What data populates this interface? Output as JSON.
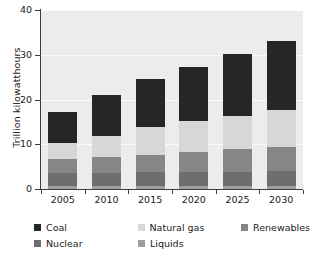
{
  "chart_data": {
    "type": "bar",
    "stacked": true,
    "title": "",
    "xlabel": "",
    "ylabel": "Trillion kilowatthours",
    "categories": [
      "2005",
      "2010",
      "2015",
      "2020",
      "2025",
      "2030"
    ],
    "ylim": [
      0,
      40
    ],
    "yticks": [
      0,
      10,
      20,
      30,
      40
    ],
    "ytick_labels": [
      "0",
      "10",
      "20",
      "30",
      "40"
    ],
    "grid": true,
    "legend_position": "bottom",
    "series": [
      {
        "name": "Liquids",
        "color": "#9e9e9e",
        "values": [
          0.7,
          0.7,
          0.6,
          0.6,
          0.6,
          0.6
        ]
      },
      {
        "name": "Nuclear",
        "color": "#6e6e6e",
        "values": [
          2.8,
          2.9,
          3.1,
          3.2,
          3.3,
          3.5
        ]
      },
      {
        "name": "Renewables",
        "color": "#868686",
        "values": [
          3.1,
          3.5,
          4.0,
          4.5,
          5.0,
          5.4
        ]
      },
      {
        "name": "Natural gas",
        "color": "#d7d7d7",
        "values": [
          3.6,
          4.7,
          6.1,
          6.9,
          7.5,
          8.2
        ]
      },
      {
        "name": "Coal",
        "color": "#262626",
        "values": [
          6.9,
          9.2,
          10.7,
          12.0,
          13.7,
          15.4
        ]
      }
    ],
    "totals": [
      17.1,
      21.0,
      24.5,
      27.2,
      30.1,
      33.1
    ],
    "annotations": []
  },
  "legend": {
    "rows": [
      [
        {
          "label": "Coal",
          "color": "#262626"
        },
        {
          "label": "Natural gas",
          "color": "#d7d7d7"
        },
        {
          "label": "Renewables",
          "color": "#868686"
        }
      ],
      [
        {
          "label": "Nuclear",
          "color": "#6e6e6e"
        },
        {
          "label": "Liquids",
          "color": "#9e9e9e"
        }
      ]
    ]
  },
  "style": {
    "plot_background": "#ececec",
    "gridline_color": "#fbfbfb",
    "axis_color": "#3d3d3d",
    "text_color": "#1a1a1a"
  }
}
